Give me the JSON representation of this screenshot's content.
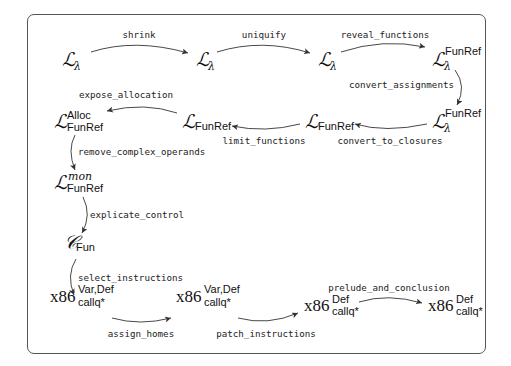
{
  "diagram": {
    "type": "compiler-pass-flow",
    "nodes": [
      {
        "id": "n1",
        "base": "L",
        "sub": "λ",
        "sup": ""
      },
      {
        "id": "n2",
        "base": "L",
        "sub": "λ",
        "sup": ""
      },
      {
        "id": "n3",
        "base": "L",
        "sub": "λ",
        "sup": ""
      },
      {
        "id": "n4",
        "base": "L",
        "sub": "λ",
        "sup": "FunRef"
      },
      {
        "id": "n5",
        "base": "L",
        "sub": "λ",
        "sup": "FunRef"
      },
      {
        "id": "n6",
        "base": "L",
        "sub": "FunRef",
        "sup": ""
      },
      {
        "id": "n7",
        "base": "L",
        "sub": "FunRef",
        "sup": ""
      },
      {
        "id": "n8",
        "base": "L",
        "sub": "FunRef",
        "sup": "Alloc"
      },
      {
        "id": "n9",
        "base": "L",
        "sub": "FunRef",
        "sup": "mon"
      },
      {
        "id": "n10",
        "base": "C",
        "sub": "Fun",
        "sup": ""
      },
      {
        "id": "n11",
        "base": "x86",
        "sub": "callq*",
        "sup": "Var,Def"
      },
      {
        "id": "n12",
        "base": "x86",
        "sub": "callq*",
        "sup": "Var,Def"
      },
      {
        "id": "n13",
        "base": "x86",
        "sub": "callq*",
        "sup": "Def"
      },
      {
        "id": "n14",
        "base": "x86",
        "sub": "callq*",
        "sup": "Def"
      }
    ],
    "edges": [
      {
        "from": "n1",
        "to": "n2",
        "label": "shrink"
      },
      {
        "from": "n2",
        "to": "n3",
        "label": "uniquify"
      },
      {
        "from": "n3",
        "to": "n4",
        "label": "reveal_functions"
      },
      {
        "from": "n4",
        "to": "n5",
        "label": "convert_assignments"
      },
      {
        "from": "n5",
        "to": "n6",
        "label": "convert_to_closures"
      },
      {
        "from": "n6",
        "to": "n7",
        "label": "limit_functions"
      },
      {
        "from": "n7",
        "to": "n8",
        "label": "expose_allocation"
      },
      {
        "from": "n8",
        "to": "n9",
        "label": "remove_complex_operands"
      },
      {
        "from": "n9",
        "to": "n10",
        "label": "explicate_control"
      },
      {
        "from": "n10",
        "to": "n11",
        "label": "select_instructions"
      },
      {
        "from": "n11",
        "to": "n12",
        "label": "assign_homes"
      },
      {
        "from": "n12",
        "to": "n13",
        "label": "patch_instructions"
      },
      {
        "from": "n13",
        "to": "n14",
        "label": "prelude_and_conclusion"
      }
    ]
  }
}
